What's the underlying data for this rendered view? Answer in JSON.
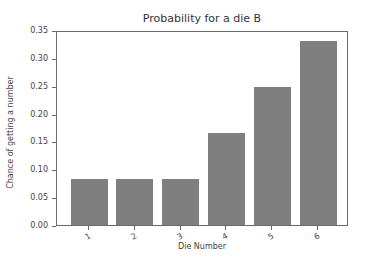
{
  "chart_data": {
    "type": "bar",
    "title": "Probability for a die B",
    "xlabel": "Die Number",
    "ylabel": "Chance of getting a number",
    "categories": [
      "1",
      "2",
      "3",
      "4",
      "5",
      "6"
    ],
    "values": [
      0.0833,
      0.0833,
      0.0833,
      0.1667,
      0.25,
      0.3333
    ],
    "ylim": [
      0,
      0.35
    ],
    "yticks": [
      "0.00",
      "0.05",
      "0.10",
      "0.15",
      "0.20",
      "0.25",
      "0.30",
      "0.35"
    ],
    "xtick_rotation": -30,
    "bar_color": "#7f7f7f",
    "grid": false,
    "legend": null
  }
}
